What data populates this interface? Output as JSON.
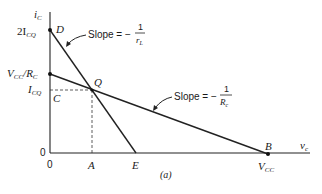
{
  "figure": {
    "caption": "(a)",
    "axes": {
      "y_label": "i",
      "y_label_sub": "C",
      "x_label": "v",
      "x_label_sub": "c",
      "origin_y_tick": "0",
      "origin_x_tick": "0"
    },
    "y_ticks": [
      {
        "main": "2I",
        "sub": "CQ"
      },
      {
        "main": "V",
        "sub": "CC",
        "suffix": "/R",
        "suffix_sub": "C"
      },
      {
        "main": "I",
        "sub": "CQ"
      }
    ],
    "x_ticks": [
      {
        "label": "A"
      },
      {
        "label": "E"
      },
      {
        "main": "V",
        "sub": "CC"
      }
    ],
    "points": {
      "D": "D",
      "Q": "Q",
      "C": "C",
      "B": "B"
    },
    "annotations": {
      "ac_slope_text": "Slope = −",
      "ac_slope_num": "1",
      "ac_slope_den": "r",
      "ac_slope_den_sub": "L",
      "dc_slope_text": "Slope = −",
      "dc_slope_num": "1",
      "dc_slope_den": "R",
      "dc_slope_den_sub": "c"
    },
    "lines": [
      {
        "name": "ac-load-line",
        "from": "D",
        "through": "Q",
        "to": "E"
      },
      {
        "name": "dc-load-line",
        "from": "V_CC/R_C",
        "through": "Q",
        "to": "B"
      }
    ]
  }
}
